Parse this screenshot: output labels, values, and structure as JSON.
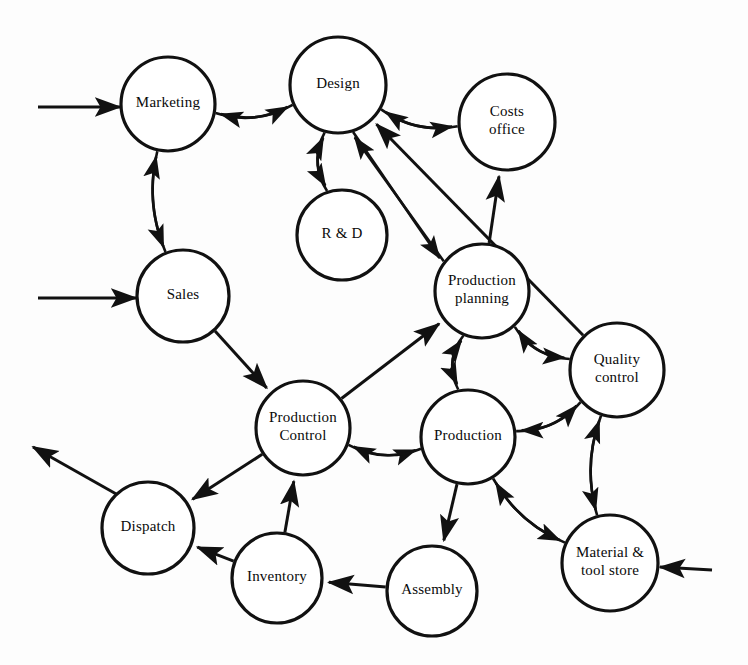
{
  "diagram": {
    "type": "node-link-diagram",
    "shape": "circle",
    "background_color": "#fdfdfd",
    "stroke_color": "#111111",
    "label_color": "#0a0a0a",
    "nodes": [
      {
        "id": "marketing",
        "label": "Marketing",
        "label_lines": [
          "Marketing"
        ],
        "cx": 168,
        "cy": 104,
        "r": 47
      },
      {
        "id": "design",
        "label": "Design",
        "label_lines": [
          "Design"
        ],
        "cx": 338,
        "cy": 85,
        "r": 48
      },
      {
        "id": "costs-office",
        "label": "Costs office",
        "label_lines": [
          "Costs",
          "office"
        ],
        "cx": 507,
        "cy": 122,
        "r": 48
      },
      {
        "id": "rd",
        "label": "R & D",
        "label_lines": [
          "R & D"
        ],
        "cx": 342,
        "cy": 235,
        "r": 45
      },
      {
        "id": "sales",
        "label": "Sales",
        "label_lines": [
          "Sales"
        ],
        "cx": 183,
        "cy": 296,
        "r": 46
      },
      {
        "id": "production-planning",
        "label": "Production planning",
        "label_lines": [
          "Production",
          "planning"
        ],
        "cx": 482,
        "cy": 291,
        "r": 47
      },
      {
        "id": "quality-control",
        "label": "Quality control",
        "label_lines": [
          "Quality",
          "control"
        ],
        "cx": 617,
        "cy": 370,
        "r": 47
      },
      {
        "id": "production-control",
        "label": "Production Control",
        "label_lines": [
          "Production",
          "Control"
        ],
        "cx": 303,
        "cy": 428,
        "r": 47
      },
      {
        "id": "production",
        "label": "Production",
        "label_lines": [
          "Production"
        ],
        "cx": 468,
        "cy": 437,
        "r": 47
      },
      {
        "id": "dispatch",
        "label": "Dispatch",
        "label_lines": [
          "Dispatch"
        ],
        "cx": 148,
        "cy": 528,
        "r": 46
      },
      {
        "id": "inventory",
        "label": "Inventory",
        "label_lines": [
          "Inventory"
        ],
        "cx": 277,
        "cy": 578,
        "r": 45
      },
      {
        "id": "assembly",
        "label": "Assembly",
        "label_lines": [
          "Assembly"
        ],
        "cx": 432,
        "cy": 591,
        "r": 45
      },
      {
        "id": "material-tool-store",
        "label": "Material & tool store",
        "label_lines": [
          "Material &",
          "tool store"
        ],
        "cx": 610,
        "cy": 563,
        "r": 48
      }
    ],
    "edges": [
      {
        "from": "marketing",
        "to": "design",
        "style": "curve"
      },
      {
        "from": "design",
        "to": "marketing",
        "style": "curve"
      },
      {
        "from": "marketing",
        "to": "sales",
        "style": "curve"
      },
      {
        "from": "sales",
        "to": "marketing",
        "style": "curve"
      },
      {
        "from": "design",
        "to": "rd",
        "style": "curve"
      },
      {
        "from": "rd",
        "to": "design",
        "style": "curve"
      },
      {
        "from": "design",
        "to": "costs-office",
        "style": "curve"
      },
      {
        "from": "costs-office",
        "to": "design",
        "style": "curve"
      },
      {
        "from": "design",
        "to": "production-planning",
        "style": "straight"
      },
      {
        "from": "production-planning",
        "to": "design",
        "style": "straight"
      },
      {
        "from": "quality-control",
        "to": "design",
        "style": "straight"
      },
      {
        "from": "production-planning",
        "to": "costs-office",
        "style": "curve"
      },
      {
        "from": "sales",
        "to": "production-control",
        "style": "straight"
      },
      {
        "from": "production-control",
        "to": "production-planning",
        "style": "curve"
      },
      {
        "from": "production-planning",
        "to": "production",
        "style": "curve"
      },
      {
        "from": "production",
        "to": "production-planning",
        "style": "curve"
      },
      {
        "from": "production-planning",
        "to": "quality-control",
        "style": "curve"
      },
      {
        "from": "quality-control",
        "to": "production-planning",
        "style": "curve"
      },
      {
        "from": "production-control",
        "to": "production",
        "style": "curve"
      },
      {
        "from": "production",
        "to": "production-control",
        "style": "curve"
      },
      {
        "from": "production",
        "to": "quality-control",
        "style": "curve"
      },
      {
        "from": "quality-control",
        "to": "production",
        "style": "curve"
      },
      {
        "from": "quality-control",
        "to": "material-tool-store",
        "style": "curve"
      },
      {
        "from": "material-tool-store",
        "to": "quality-control",
        "style": "curve"
      },
      {
        "from": "production",
        "to": "material-tool-store",
        "style": "curve"
      },
      {
        "from": "material-tool-store",
        "to": "production",
        "style": "curve"
      },
      {
        "from": "production",
        "to": "assembly",
        "style": "straight"
      },
      {
        "from": "inventory",
        "to": "production-control",
        "style": "curve"
      },
      {
        "from": "production-control",
        "to": "dispatch",
        "style": "straight"
      },
      {
        "from": "inventory",
        "to": "dispatch",
        "style": "straight"
      },
      {
        "from": "assembly",
        "to": "inventory",
        "style": "straight"
      }
    ],
    "external_edges": [
      {
        "id": "external-in-marketing",
        "direction": "in",
        "target": "marketing",
        "from_x": 38,
        "from_y": 107,
        "to_x": 120,
        "to_y": 107
      },
      {
        "id": "external-in-sales",
        "direction": "in",
        "target": "sales",
        "from_x": 38,
        "from_y": 298,
        "to_x": 136,
        "to_y": 298
      },
      {
        "id": "external-out-dispatch",
        "direction": "out",
        "source": "dispatch",
        "from_x": 118,
        "from_y": 495,
        "to_x": 33,
        "to_y": 447
      },
      {
        "id": "external-in-material-store",
        "direction": "in",
        "target": "material-tool-store",
        "from_x": 712,
        "from_y": 570,
        "to_x": 660,
        "to_y": 567
      }
    ]
  }
}
